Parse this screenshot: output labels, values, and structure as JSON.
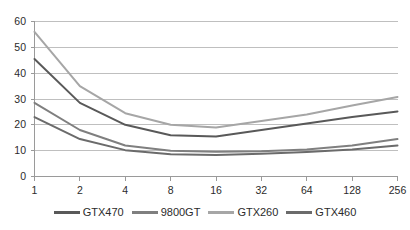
{
  "chart_data": {
    "type": "line",
    "title": "",
    "subtitle": "",
    "xlabel": "",
    "ylabel": "",
    "x": [
      1,
      2,
      4,
      8,
      16,
      32,
      64,
      128,
      256
    ],
    "x_tick_labels": [
      "1",
      "2",
      "4",
      "8",
      "16",
      "32",
      "64",
      "128",
      "256"
    ],
    "x_scale": "log2-categorical",
    "y_tick_labels": [
      "0",
      "10",
      "20",
      "30",
      "40",
      "50",
      "60"
    ],
    "y_ticks": [
      0,
      10,
      20,
      30,
      40,
      50,
      60
    ],
    "ylim": [
      0,
      60
    ],
    "grid": "horizontal",
    "legend_position": "bottom",
    "series": [
      {
        "name": "GTX470",
        "color": "#595959",
        "values": [
          45.5,
          28.5,
          20.0,
          16.0,
          15.5,
          18.0,
          20.5,
          23.0,
          25.2
        ]
      },
      {
        "name": "9800GT",
        "color": "#7f7f7f",
        "values": [
          28.5,
          18.0,
          12.0,
          10.0,
          9.6,
          9.8,
          10.5,
          12.0,
          14.5
        ]
      },
      {
        "name": "GTX260",
        "color": "#a6a6a6",
        "values": [
          56.0,
          35.0,
          24.5,
          20.0,
          19.0,
          21.5,
          24.0,
          27.5,
          30.8
        ]
      },
      {
        "name": "GTX460",
        "color": "#6b6b6b",
        "values": [
          23.0,
          14.5,
          10.2,
          8.6,
          8.3,
          8.8,
          9.5,
          10.5,
          12.0
        ]
      }
    ]
  },
  "axes": {
    "axis_line_color": "#9a9a9a",
    "gridline_color": "#bfbfbf",
    "tick_color": "#9a9a9a"
  },
  "legend": {
    "entries": [
      {
        "label": "GTX470",
        "color": "#595959"
      },
      {
        "label": "9800GT",
        "color": "#7f7f7f"
      },
      {
        "label": "GTX260",
        "color": "#a6a6a6"
      },
      {
        "label": "GTX460",
        "color": "#6b6b6b"
      }
    ]
  }
}
